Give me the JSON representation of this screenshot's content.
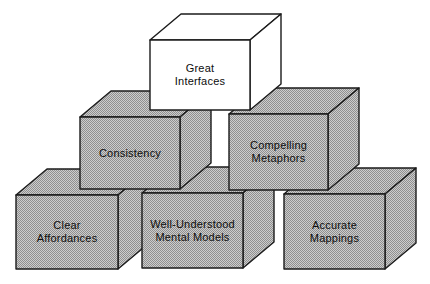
{
  "diagram": {
    "title_hidden": "",
    "background_color": "#ffffff",
    "stroke_color": "#1b1b1b",
    "stroke_width": 1.4,
    "texture_light_color": "#cdcdcd",
    "texture_dark_color": "#8f8f8f",
    "white_block_color": "#ffffff",
    "text_color": "#0d0d0d",
    "font_size": 11,
    "line_height": 13,
    "depth": {
      "dx": 31,
      "dy": 26
    },
    "rows": {
      "top": [
        "Great Interfaces"
      ],
      "middle": [
        "Consistency",
        "Compelling Metaphors"
      ],
      "bottom": [
        "Clear Affordances",
        "Well-Understood Mental Models",
        "Accurate Mappings"
      ]
    },
    "boxes": [
      {
        "id": "clear-affordances",
        "label_lines": [
          "Clear",
          "Affordances"
        ],
        "fill": "halftone",
        "x": 16,
        "y": 195,
        "w": 102,
        "h": 74
      },
      {
        "id": "well-understood-mental-models",
        "label_lines": [
          "Well-Understood",
          "Mental Models"
        ],
        "fill": "halftone",
        "x": 142,
        "y": 193,
        "w": 101,
        "h": 75
      },
      {
        "id": "accurate-mappings",
        "label_lines": [
          "Accurate",
          "Mappings"
        ],
        "fill": "halftone",
        "x": 284,
        "y": 194,
        "w": 101,
        "h": 75
      },
      {
        "id": "consistency",
        "label_lines": [
          "Consistency"
        ],
        "fill": "halftone",
        "x": 80,
        "y": 117,
        "w": 100,
        "h": 72
      },
      {
        "id": "compelling-metaphors",
        "label_lines": [
          "Compelling",
          "Metaphors"
        ],
        "fill": "halftone",
        "x": 229,
        "y": 114,
        "w": 99,
        "h": 76
      },
      {
        "id": "great-interfaces",
        "label_lines": [
          "Great",
          "Interfaces"
        ],
        "fill": "white",
        "x": 150,
        "y": 40,
        "w": 100,
        "h": 70
      }
    ]
  }
}
